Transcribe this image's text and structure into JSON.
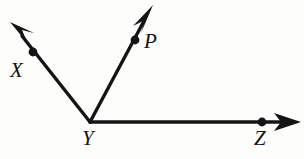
{
  "figure": {
    "type": "geometry-diagram",
    "background_color": "#fdfdfc",
    "ink_color": "#141414",
    "width": 304,
    "height": 159,
    "vertex": {
      "name": "Y",
      "x": 90,
      "y": 122
    },
    "rays": [
      {
        "id": "YX",
        "label": "X",
        "from": {
          "x": 90,
          "y": 122
        },
        "to": {
          "x": 12,
          "y": 23
        },
        "dot": {
          "x": 33,
          "y": 52
        },
        "label_pos": {
          "x": 10,
          "y": 60
        },
        "direction": "up-left",
        "angle_deg": 128
      },
      {
        "id": "YP",
        "label": "P",
        "from": {
          "x": 90,
          "y": 122
        },
        "to": {
          "x": 152,
          "y": 6
        },
        "dot": {
          "x": 135,
          "y": 40
        },
        "label_pos": {
          "x": 144,
          "y": 31
        },
        "direction": "up-right",
        "angle_deg": 62
      },
      {
        "id": "YZ",
        "label": "Z",
        "from": {
          "x": 90,
          "y": 122
        },
        "to": {
          "x": 300,
          "y": 122
        },
        "dot": {
          "x": 262,
          "y": 122
        },
        "label_pos": {
          "x": 254,
          "y": 128
        },
        "direction": "right",
        "angle_deg": 0
      }
    ],
    "labels": {
      "x": "X",
      "p": "P",
      "y": "Y",
      "z": "Z"
    },
    "stroke_width": 3.2,
    "dot_radius": 4.2
  }
}
